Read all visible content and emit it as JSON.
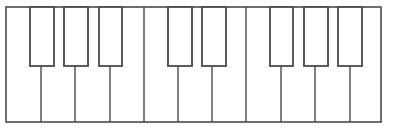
{
  "diagram": {
    "type": "piano-keyboard",
    "white_key_count": 11,
    "black_key_count": 8,
    "black_key_pattern": [
      3,
      2,
      3
    ],
    "colors": {
      "background": "#ffffff",
      "outline": "#4a4a4a",
      "key_fill": "#ffffff"
    },
    "frame": {
      "x": 6,
      "y": 7,
      "width": 375,
      "height": 115
    },
    "white_key_dividers_x": [
      41,
      75,
      110,
      144,
      178,
      212,
      246,
      281,
      315,
      350
    ],
    "black_keys": [
      {
        "x": 30,
        "width": 24
      },
      {
        "x": 64,
        "width": 24
      },
      {
        "x": 99,
        "width": 23
      },
      {
        "x": 168,
        "width": 24
      },
      {
        "x": 202,
        "width": 24
      },
      {
        "x": 270,
        "width": 23
      },
      {
        "x": 304,
        "width": 24
      },
      {
        "x": 338,
        "width": 24
      }
    ],
    "black_key_top": 7,
    "black_key_bottom": 66
  }
}
